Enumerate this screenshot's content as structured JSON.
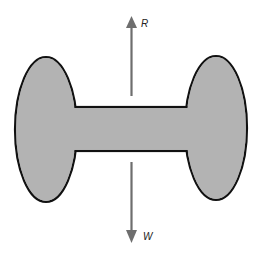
{
  "diagram": {
    "type": "free-body-diagram",
    "body": {
      "fill_color": "#b3b3b3",
      "outline_color": "#111111",
      "left_lobe": {
        "cx": 46,
        "cy": 129.5,
        "rx": 31,
        "ry": 72.5
      },
      "right_lobe": {
        "cx": 216,
        "cy": 128,
        "rx": 31,
        "ry": 72
      },
      "connecting_bar": {
        "x1": 77,
        "x2": 186,
        "y_top": 107,
        "y_bottom": 151
      }
    },
    "forces": [
      {
        "id": "upward",
        "label": "R",
        "direction": "up",
        "color": "#6e6e6e",
        "shaft": {
          "x": 131,
          "y_start": 96,
          "y_end": 27
        },
        "tip": {
          "x": 131,
          "y": 16
        },
        "label_pos": {
          "x": 141,
          "y": 26
        }
      },
      {
        "id": "downward",
        "label": "W",
        "direction": "down",
        "color": "#6e6e6e",
        "shaft": {
          "x": 131,
          "y_start": 162,
          "y_end": 231
        },
        "tip": {
          "x": 131,
          "y": 243
        },
        "label_pos": {
          "x": 143,
          "y": 240
        }
      }
    ]
  }
}
